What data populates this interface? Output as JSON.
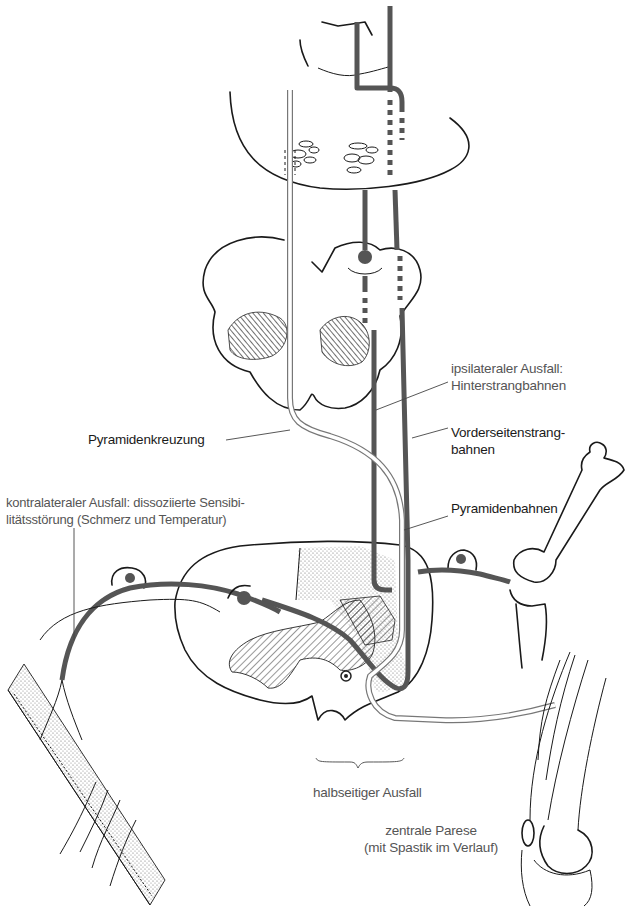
{
  "diagram": {
    "colors": {
      "tract_grey": "#555555",
      "outline_black": "#1a1a1a",
      "label_black": "#1a1a1a",
      "label_grey": "#555555",
      "background": "#ffffff"
    },
    "labels": {
      "ipsilateral": {
        "line1": "ipsilateraler Ausfall:",
        "line2": "Hinterstrangbahnen"
      },
      "vorderseitenstrang": {
        "line1": "Vorderseitenstrang-",
        "line2": "bahnen"
      },
      "pyramidenbahnen": "Pyramidenbahnen",
      "pyramidenkreuzung": "Pyramidenkreuzung",
      "kontralateral": {
        "line1": "kontralateraler Ausfall: dissoziierte Sensibi-",
        "line2": "litätsstörung (Schmerz und Temperatur)"
      },
      "halbseitig": "halbseitiger Ausfall",
      "zentrale_parese": {
        "line1": "zentrale Parese",
        "line2": "(mit Spastik im Verlauf)"
      }
    },
    "structures": [
      "brainstem-thalamus",
      "medulla-oblongata",
      "spinal-cord-cross-section",
      "dorsal-root-ganglion-left",
      "dorsal-root-ganglion-right",
      "skin-dermatome",
      "knee-joint-bones",
      "thigh-muscle-knee"
    ]
  }
}
